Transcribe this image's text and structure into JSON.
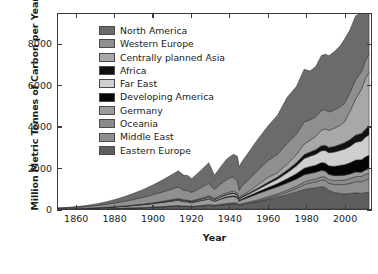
{
  "chart_data": {
    "type": "area",
    "title": "",
    "xlabel": "Year",
    "ylabel": "Million Metric Tonnes of Carbon per Year",
    "xlim": [
      1850,
      2014
    ],
    "ylim": [
      0,
      9500
    ],
    "xticks": [
      1860,
      1880,
      1900,
      1920,
      1940,
      1960,
      1980,
      2000
    ],
    "yticks": [
      0,
      2000,
      4000,
      6000,
      8000
    ],
    "grid": false,
    "stacked": true,
    "legend_position": "upper-left-inside",
    "legend_entries": [
      "North America",
      "Western Europe",
      "Centrally planned Asia",
      "Africa",
      "Far East",
      "Developing America",
      "Germany",
      "Oceania",
      "Middle East",
      "Eastern Europe"
    ],
    "colors": {
      "North America": "#6b6b6b",
      "Western Europe": "#8f8f8f",
      "Centrally planned Asia": "#a8a8a8",
      "Africa": "#111111",
      "Far East": "#cfcfcf",
      "Developing America": "#050505",
      "Germany": "#9c9c9c",
      "Oceania": "#8a8a8a",
      "Middle East": "#8f8f8f",
      "Eastern Europe": "#5e5e5e",
      "axis": "#3a3a3a",
      "text": "#1a1a1a",
      "background": "#ffffff"
    },
    "x": [
      1850,
      1855,
      1860,
      1865,
      1870,
      1875,
      1880,
      1885,
      1890,
      1895,
      1900,
      1905,
      1910,
      1913,
      1916,
      1918,
      1920,
      1925,
      1929,
      1932,
      1935,
      1938,
      1940,
      1942,
      1944,
      1945,
      1946,
      1950,
      1955,
      1960,
      1965,
      1970,
      1975,
      1979,
      1982,
      1985,
      1988,
      1990,
      1992,
      1995,
      1998,
      2000,
      2003,
      2006,
      2009,
      2011,
      2013
    ],
    "series": [
      {
        "name": "Eastern Europe",
        "stack_order_from_bottom": 1,
        "values": [
          2,
          3,
          5,
          8,
          12,
          18,
          26,
          36,
          48,
          62,
          80,
          103,
          128,
          142,
          120,
          118,
          100,
          140,
          175,
          150,
          185,
          215,
          235,
          250,
          230,
          170,
          200,
          270,
          360,
          470,
          580,
          700,
          830,
          950,
          1000,
          1030,
          1090,
          1060,
          900,
          800,
          760,
          740,
          760,
          790,
          760,
          800,
          830
        ]
      },
      {
        "name": "Middle East",
        "stack_order_from_bottom": 2,
        "values": [
          0,
          0,
          0,
          0,
          0,
          0,
          0,
          0,
          1,
          1,
          2,
          3,
          4,
          5,
          5,
          5,
          6,
          8,
          11,
          10,
          13,
          16,
          18,
          19,
          19,
          17,
          20,
          26,
          40,
          60,
          85,
          120,
          175,
          235,
          265,
          285,
          315,
          330,
          350,
          390,
          430,
          450,
          490,
          540,
          570,
          610,
          640
        ]
      },
      {
        "name": "Oceania",
        "stack_order_from_bottom": 3,
        "values": [
          0,
          1,
          1,
          2,
          3,
          4,
          6,
          8,
          10,
          12,
          15,
          18,
          22,
          24,
          23,
          22,
          22,
          26,
          32,
          27,
          31,
          35,
          38,
          40,
          40,
          36,
          38,
          44,
          54,
          65,
          78,
          95,
          112,
          130,
          140,
          150,
          165,
          172,
          180,
          195,
          210,
          220,
          235,
          250,
          258,
          270,
          278
        ]
      },
      {
        "name": "Germany",
        "stack_order_from_bottom": 4,
        "values": [
          9,
          13,
          19,
          27,
          38,
          52,
          70,
          90,
          112,
          138,
          168,
          200,
          232,
          250,
          205,
          198,
          175,
          228,
          265,
          185,
          240,
          285,
          300,
          300,
          255,
          140,
          175,
          230,
          300,
          330,
          340,
          350,
          345,
          355,
          330,
          320,
          310,
          285,
          255,
          240,
          235,
          230,
          225,
          225,
          205,
          215,
          215
        ]
      },
      {
        "name": "Developing America",
        "stack_order_from_bottom": 5,
        "values": [
          0,
          0,
          0,
          0,
          1,
          1,
          2,
          3,
          4,
          6,
          8,
          11,
          15,
          18,
          17,
          17,
          18,
          24,
          33,
          28,
          34,
          40,
          45,
          48,
          50,
          48,
          54,
          70,
          95,
          125,
          160,
          205,
          265,
          320,
          335,
          350,
          380,
          395,
          415,
          455,
          495,
          515,
          540,
          585,
          610,
          640,
          665
        ]
      },
      {
        "name": "Far East",
        "stack_order_from_bottom": 6,
        "values": [
          0,
          0,
          1,
          1,
          2,
          3,
          5,
          7,
          9,
          12,
          16,
          21,
          28,
          33,
          35,
          35,
          36,
          46,
          60,
          55,
          68,
          82,
          90,
          92,
          80,
          55,
          65,
          85,
          120,
          165,
          215,
          290,
          380,
          470,
          500,
          530,
          580,
          610,
          640,
          700,
          730,
          755,
          800,
          860,
          905,
          955,
          995
        ]
      },
      {
        "name": "Africa",
        "stack_order_from_bottom": 7,
        "values": [
          0,
          0,
          0,
          1,
          1,
          2,
          2,
          3,
          4,
          6,
          8,
          10,
          13,
          15,
          15,
          15,
          16,
          20,
          26,
          24,
          29,
          34,
          37,
          39,
          40,
          38,
          42,
          52,
          68,
          85,
          105,
          130,
          160,
          195,
          210,
          222,
          240,
          250,
          260,
          280,
          300,
          312,
          330,
          355,
          375,
          395,
          415
        ]
      },
      {
        "name": "Centrally planned Asia",
        "stack_order_from_bottom": 8,
        "values": [
          0,
          0,
          0,
          1,
          1,
          2,
          3,
          4,
          6,
          8,
          11,
          15,
          20,
          24,
          25,
          25,
          26,
          34,
          45,
          42,
          52,
          64,
          72,
          76,
          70,
          50,
          60,
          85,
          160,
          240,
          200,
          290,
          390,
          510,
          570,
          640,
          760,
          800,
          830,
          880,
          930,
          1010,
          1380,
          1760,
          2150,
          2450,
          2620
        ]
      },
      {
        "name": "Western Europe",
        "stack_order_from_bottom": 9,
        "values": [
          30,
          42,
          60,
          82,
          110,
          145,
          185,
          230,
          280,
          335,
          395,
          455,
          520,
          560,
          470,
          455,
          410,
          520,
          600,
          430,
          545,
          640,
          680,
          690,
          600,
          360,
          440,
          580,
          720,
          820,
          900,
          1010,
          1000,
          1080,
          990,
          960,
          960,
          940,
          900,
          890,
          900,
          905,
          915,
          930,
          860,
          880,
          890
        ]
      },
      {
        "name": "North America",
        "stack_order_from_bottom": 10,
        "values": [
          12,
          20,
          33,
          52,
          80,
          118,
          168,
          228,
          300,
          385,
          480,
          590,
          710,
          790,
          730,
          740,
          670,
          840,
          1010,
          690,
          830,
          980,
          1030,
          1110,
          1180,
          1140,
          1160,
          1340,
          1520,
          1680,
          1900,
          2240,
          2320,
          2560,
          2380,
          2440,
          2680,
          2700,
          2740,
          2860,
          2980,
          3120,
          3060,
          3120,
          2870,
          2900,
          2880
        ]
      }
    ],
    "peak_total_value": 9400,
    "peak_year": 2013
  },
  "axis": {
    "xlabel": "Year",
    "ylabel": "Million Metric Tonnes of Carbon per Year",
    "xticklabels": [
      "1860",
      "1880",
      "1900",
      "1920",
      "1940",
      "1960",
      "1980",
      "2000"
    ],
    "yticklabels": [
      "0",
      "2000",
      "4000",
      "6000",
      "8000"
    ]
  }
}
